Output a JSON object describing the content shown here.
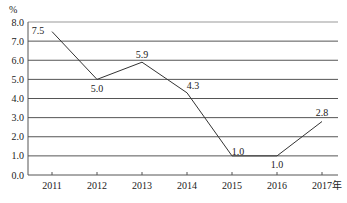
{
  "chart_data": {
    "type": "line",
    "title": "",
    "xlabel": "",
    "ylabel": "%",
    "x_unit_suffix": "年",
    "categories": [
      "2011",
      "2012",
      "2013",
      "2014",
      "2015",
      "2016",
      "2017年"
    ],
    "series": [
      {
        "name": "growth",
        "values": [
          7.5,
          5.0,
          5.9,
          4.3,
          1.0,
          1.0,
          2.8
        ]
      }
    ],
    "data_labels": [
      "7.5",
      "5.0",
      "5.9",
      "4.3",
      "1.0",
      "1.0",
      "2.8"
    ],
    "ylim": [
      0.0,
      8.0
    ],
    "yticks": [
      "0.0",
      "1.0",
      "2.0",
      "3.0",
      "4.0",
      "5.0",
      "6.0",
      "7.0",
      "8.0"
    ],
    "grid": true,
    "legend": null
  },
  "colors": {
    "line": "#333333",
    "grid": "#555555",
    "text": "#222222"
  }
}
